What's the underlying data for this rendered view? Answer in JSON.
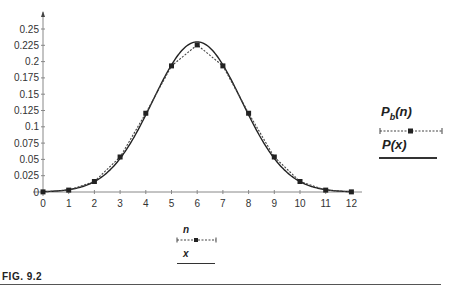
{
  "chart_data": {
    "type": "line",
    "title": "",
    "xlabel": "",
    "ylabel": "",
    "xlim": [
      0,
      12
    ],
    "ylim": [
      0,
      0.25
    ],
    "grid": false,
    "x_ticks": [
      "0",
      "1",
      "2",
      "3",
      "4",
      "5",
      "6",
      "7",
      "8",
      "9",
      "10",
      "11",
      "12"
    ],
    "y_ticks": [
      "0",
      "0.025",
      "0.05",
      "0.075",
      "0.1",
      "0.125",
      "0.15",
      "0.175",
      "0.2",
      "0.225",
      "0.25"
    ],
    "x": [
      0,
      1,
      2,
      3,
      4,
      5,
      6,
      7,
      8,
      9,
      10,
      11,
      12
    ],
    "series": [
      {
        "name": "Pb(n)",
        "style": "dotted line with square markers",
        "values": [
          0.0002,
          0.0029,
          0.0161,
          0.0537,
          0.1208,
          0.1934,
          0.2256,
          0.1934,
          0.1208,
          0.0537,
          0.0161,
          0.0029,
          0.0002
        ]
      },
      {
        "name": "P(x)",
        "style": "solid smooth curve",
        "function": "gaussian",
        "mean": 6,
        "variance": 3,
        "peak": 0.2303
      }
    ],
    "legend_position": "right"
  },
  "legend": {
    "right": {
      "pb_label_main": "P",
      "pb_label_sub": "b",
      "pb_label_arg": "(n)",
      "p_label": "P(x)"
    },
    "bottom": {
      "n_label": "n",
      "x_label": "x"
    }
  },
  "caption": {
    "text": "FIG. 9.2"
  },
  "colors": {
    "axis": "#888888",
    "curve": "#222222",
    "dotted": "#444444",
    "marker": "#222222"
  }
}
